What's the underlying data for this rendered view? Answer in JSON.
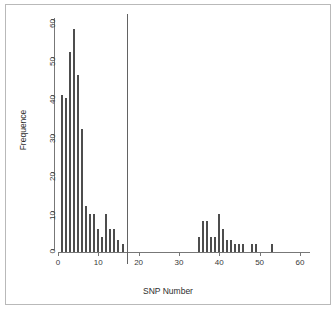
{
  "chart_data": {
    "type": "bar",
    "title": "",
    "subtitle": "",
    "xlabel": "SNP Number",
    "ylabel": "Frequence",
    "xlim": [
      0,
      62.5
    ],
    "ylim": [
      0,
      62
    ],
    "xticks": [
      0,
      10,
      20,
      30,
      40,
      50,
      60
    ],
    "xtick_labels": [
      "0",
      "10",
      "20",
      "30",
      "40",
      "50",
      "60"
    ],
    "yticks": [
      0,
      10,
      20,
      30,
      40,
      50,
      60
    ],
    "ytick_labels": [
      "0",
      "10",
      "20",
      "30",
      "40",
      "50",
      "60"
    ],
    "grid": false,
    "legend": null,
    "bar_color": "#4d4d4d",
    "axis_color": "#777777",
    "style": "spike-histogram",
    "x": [
      1,
      2,
      3,
      4,
      5,
      6,
      7,
      8,
      9,
      10,
      11,
      12,
      13,
      14,
      15,
      16,
      35,
      36,
      37,
      38,
      39,
      40,
      41,
      42,
      43,
      44,
      45,
      46,
      48,
      49,
      53
    ],
    "values": [
      41,
      40,
      52,
      58,
      46,
      32,
      12,
      10,
      10,
      6,
      4,
      10,
      6,
      6,
      3,
      2,
      4,
      8,
      8,
      4,
      4,
      10,
      6,
      3,
      3,
      2,
      2,
      2,
      2,
      2,
      2
    ],
    "categories": [
      "1",
      "2",
      "3",
      "4",
      "5",
      "6",
      "7",
      "8",
      "9",
      "10",
      "11",
      "12",
      "13",
      "14",
      "15",
      "16",
      "35",
      "36",
      "37",
      "38",
      "39",
      "40",
      "41",
      "42",
      "43",
      "44",
      "45",
      "46",
      "48",
      "49",
      "53"
    ],
    "annotations": [
      {
        "type": "vertical-line",
        "name": "threshold-line",
        "x": 17,
        "color": "#636363",
        "label": ""
      }
    ]
  }
}
